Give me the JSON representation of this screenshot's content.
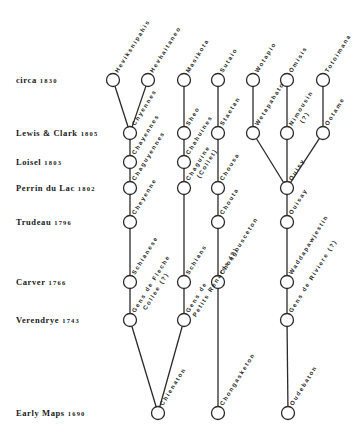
{
  "diagram": {
    "rows": [
      {
        "id": "circa",
        "name": "circa",
        "year": "1830",
        "y": 80
      },
      {
        "id": "lewis-clark",
        "name": "Lewis & Clark",
        "year": "1805",
        "y": 133
      },
      {
        "id": "loisel",
        "name": "Loisel",
        "year": "1803",
        "y": 162
      },
      {
        "id": "perrin",
        "name": "Perrin du Lac",
        "year": "1802",
        "y": 188
      },
      {
        "id": "trudeau",
        "name": "Trudeau",
        "year": "1796",
        "y": 222
      },
      {
        "id": "carver",
        "name": "Carver",
        "year": "1766",
        "y": 282
      },
      {
        "id": "verendrye",
        "name": "Verendrye",
        "year": "1743",
        "y": 320
      },
      {
        "id": "early-maps",
        "name": "Early Maps",
        "year": "1690",
        "y": 413
      }
    ],
    "nodes": [
      {
        "id": "heviksnipahis",
        "x": 113,
        "y": 80,
        "label": "Heviksnipahis"
      },
      {
        "id": "hevhaitaneo",
        "x": 148,
        "y": 80,
        "label": "Hevhaitaneo"
      },
      {
        "id": "masikota",
        "x": 184,
        "y": 80,
        "label": "Masikota"
      },
      {
        "id": "sutaio",
        "x": 218,
        "y": 80,
        "label": "Sutaio"
      },
      {
        "id": "wotapio",
        "x": 253,
        "y": 80,
        "label": "Wotapio"
      },
      {
        "id": "omisis",
        "x": 287,
        "y": 80,
        "label": "Omisis"
      },
      {
        "id": "totoimana",
        "x": 323,
        "y": 80,
        "label": "Totoimana"
      },
      {
        "id": "chyennes",
        "x": 130,
        "y": 133,
        "label": "Chyennes"
      },
      {
        "id": "sheo",
        "x": 184,
        "y": 133,
        "label": "Sheo"
      },
      {
        "id": "staetan",
        "x": 218,
        "y": 133,
        "label": "Staetan"
      },
      {
        "id": "wetapahato",
        "x": 253,
        "y": 133,
        "label": "Wetapahato"
      },
      {
        "id": "nimousin",
        "x": 287,
        "y": 133,
        "label": "Nimousin",
        "sub": "(?)"
      },
      {
        "id": "ootame",
        "x": 323,
        "y": 133,
        "label": "Ootame"
      },
      {
        "id": "chayennes",
        "x": 130,
        "y": 162,
        "label": "Chayennes"
      },
      {
        "id": "chahuines",
        "x": 184,
        "y": 162,
        "label": "Chahuines"
      },
      {
        "id": "chaguyennes",
        "x": 130,
        "y": 188,
        "label": "Chaguyennes"
      },
      {
        "id": "chaguine",
        "x": 184,
        "y": 188,
        "label": "Chaguine",
        "sub": "(Collet)"
      },
      {
        "id": "chousa",
        "x": 218,
        "y": 188,
        "label": "Chousa"
      },
      {
        "id": "ouisy",
        "x": 287,
        "y": 188,
        "label": "Ouisy"
      },
      {
        "id": "cheyenne",
        "x": 130,
        "y": 222,
        "label": "Cheyenne"
      },
      {
        "id": "chouta",
        "x": 218,
        "y": 222,
        "label": "Chouta"
      },
      {
        "id": "ouisay",
        "x": 287,
        "y": 222,
        "label": "Ouisay"
      },
      {
        "id": "schianese",
        "x": 130,
        "y": 282,
        "label": "Schianese"
      },
      {
        "id": "schians",
        "x": 184,
        "y": 282,
        "label": "Schians"
      },
      {
        "id": "chongousceton",
        "x": 218,
        "y": 282,
        "label": "Chongousceton"
      },
      {
        "id": "waddapawjestin",
        "x": 287,
        "y": 282,
        "label": "Waddapawjestin"
      },
      {
        "id": "gens-de-fleche-collee",
        "x": 130,
        "y": 320,
        "label": "Gens de Fleche",
        "sub": "Collee (?)"
      },
      {
        "id": "gens-de-petits-renards",
        "x": 184,
        "y": 320,
        "label": "Gens de",
        "sub": "Petits Renards (?)"
      },
      {
        "id": "gens-de-riviere",
        "x": 287,
        "y": 320,
        "label": "Gens de Riviere (?)"
      },
      {
        "id": "chienaton",
        "x": 158,
        "y": 413,
        "label": "Chienaton"
      },
      {
        "id": "chongasketon",
        "x": 218,
        "y": 413,
        "label": "Chongasketon"
      },
      {
        "id": "oudebaton",
        "x": 288,
        "y": 413,
        "label": "Oudebaton"
      }
    ],
    "edges": [
      [
        "heviksnipahis",
        "chyennes"
      ],
      [
        "hevhaitaneo",
        "chyennes"
      ],
      [
        "chyennes",
        "chayennes"
      ],
      [
        "chayennes",
        "chaguyennes"
      ],
      [
        "chaguyennes",
        "cheyenne"
      ],
      [
        "cheyenne",
        "schianese"
      ],
      [
        "schianese",
        "gens-de-fleche-collee"
      ],
      [
        "gens-de-fleche-collee",
        "chienaton"
      ],
      [
        "masikota",
        "sheo"
      ],
      [
        "sheo",
        "chahuines"
      ],
      [
        "chahuines",
        "chaguine"
      ],
      [
        "chaguine",
        "schians"
      ],
      [
        "schians",
        "gens-de-petits-renards"
      ],
      [
        "gens-de-petits-renards",
        "chienaton"
      ],
      [
        "sutaio",
        "staetan"
      ],
      [
        "staetan",
        "chousa"
      ],
      [
        "chousa",
        "chouta"
      ],
      [
        "chouta",
        "chongousceton"
      ],
      [
        "chongousceton",
        "chongasketon"
      ],
      [
        "wotapio",
        "wetapahato"
      ],
      [
        "omisis",
        "nimousin"
      ],
      [
        "totoimana",
        "ootame"
      ],
      [
        "wetapahato",
        "ouisy"
      ],
      [
        "nimousin",
        "ouisy"
      ],
      [
        "ootame",
        "ouisy"
      ],
      [
        "ouisy",
        "ouisay"
      ],
      [
        "ouisay",
        "waddapawjestin"
      ],
      [
        "waddapawjestin",
        "gens-de-riviere"
      ],
      [
        "gens-de-riviere",
        "oudebaton"
      ]
    ],
    "style": {
      "line_color": "#2a2a2a",
      "node_fill": "#ffffff",
      "background": "#ffffff",
      "node_radius": 6.5
    }
  }
}
